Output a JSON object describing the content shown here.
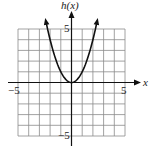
{
  "chart_data": {
    "type": "line",
    "title": "",
    "function": "h(x) = x^2",
    "xlabel": "x",
    "ylabel": "h(x)",
    "xlim": [
      -5,
      5
    ],
    "ylim": [
      -5,
      5
    ],
    "grid": true,
    "grid_step": 1,
    "tick_labels": {
      "x": [
        "-5",
        "5"
      ],
      "y": [
        "5",
        "-5"
      ]
    },
    "series": [
      {
        "name": "h(x)",
        "x": [
          -2.4,
          -2,
          -1,
          0,
          1,
          2,
          2.4
        ],
        "y": [
          5.76,
          4,
          1,
          0,
          1,
          4,
          5.76
        ]
      }
    ],
    "annotations": [
      "arrowheads at both ends of the curve"
    ]
  },
  "labels": {
    "y_axis": "h(x)",
    "x_axis": "x",
    "x_min": "−5",
    "x_max": "5",
    "y_max": "5",
    "y_min": "−5"
  }
}
